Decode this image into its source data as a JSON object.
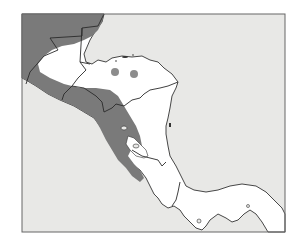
{
  "map": {
    "title": "",
    "region": "Central America",
    "colors": {
      "sea": "#e8e8e6",
      "land": "#ffffff",
      "distribution_range": "#7a7a7a",
      "isolated_records": "#8c8c8c",
      "borders": "#2a2a2a"
    },
    "layers": [
      {
        "name": "sea",
        "description": "Pacific Ocean and Caribbean Sea, light gray"
      },
      {
        "name": "land",
        "description": "Central American landmass, white"
      },
      {
        "name": "distribution_range",
        "description": "Dark gray shaded range along the Pacific slope from Mexico/Guatemala through El Salvador, western Honduras and Nicaragua to northwestern Costa Rica"
      },
      {
        "name": "isolated_records",
        "description": "Two gray dots in northern Honduras",
        "count": 2
      },
      {
        "name": "country_borders",
        "description": "National boundaries"
      }
    ],
    "labels": []
  }
}
